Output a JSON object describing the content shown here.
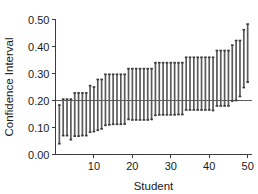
{
  "chart_data": {
    "type": "bar",
    "title": "",
    "subtitle": "",
    "xlabel": "Student",
    "ylabel": "Confidence Interval",
    "xlim": [
      0,
      51
    ],
    "ylim": [
      0.0,
      0.5
    ],
    "grid": false,
    "legend": null,
    "x_ticks": [
      10,
      20,
      30,
      40,
      50
    ],
    "x_tick_labels": [
      "10",
      "20",
      "30",
      "40",
      "50"
    ],
    "y_ticks": [
      0.0,
      0.1,
      0.2,
      0.3,
      0.4,
      0.5
    ],
    "y_tick_labels": [
      "0.00",
      "0.10",
      "0.20",
      "0.30",
      "0.40",
      "0.50"
    ],
    "reference_line": {
      "orientation": "horizontal",
      "value": 0.2,
      "label": ""
    },
    "categories": [
      1,
      2,
      3,
      4,
      5,
      6,
      7,
      8,
      9,
      10,
      11,
      12,
      13,
      14,
      15,
      16,
      17,
      18,
      19,
      20,
      21,
      22,
      23,
      24,
      25,
      26,
      27,
      28,
      29,
      30,
      31,
      32,
      33,
      34,
      35,
      36,
      37,
      38,
      39,
      40,
      41,
      42,
      43,
      44,
      45,
      46,
      47,
      48,
      49,
      50
    ],
    "series": [
      {
        "name": "lower",
        "values": [
          0.04,
          0.07,
          0.07,
          0.055,
          0.068,
          0.068,
          0.07,
          0.07,
          0.083,
          0.085,
          0.09,
          0.095,
          0.108,
          0.11,
          0.112,
          0.112,
          0.112,
          0.113,
          0.13,
          0.128,
          0.128,
          0.128,
          0.128,
          0.128,
          0.13,
          0.145,
          0.147,
          0.147,
          0.147,
          0.147,
          0.147,
          0.148,
          0.148,
          0.165,
          0.165,
          0.165,
          0.165,
          0.165,
          0.165,
          0.165,
          0.163,
          0.18,
          0.18,
          0.18,
          0.18,
          0.198,
          0.2,
          0.215,
          0.248,
          0.268
        ]
      },
      {
        "name": "upper",
        "values": [
          0.183,
          0.205,
          0.205,
          0.205,
          0.228,
          0.228,
          0.228,
          0.228,
          0.255,
          0.25,
          0.278,
          0.278,
          0.297,
          0.297,
          0.297,
          0.297,
          0.297,
          0.297,
          0.318,
          0.318,
          0.318,
          0.318,
          0.318,
          0.318,
          0.318,
          0.34,
          0.34,
          0.34,
          0.34,
          0.34,
          0.34,
          0.34,
          0.34,
          0.36,
          0.36,
          0.36,
          0.36,
          0.36,
          0.36,
          0.36,
          0.36,
          0.385,
          0.385,
          0.385,
          0.385,
          0.405,
          0.422,
          0.422,
          0.462,
          0.483
        ]
      }
    ]
  }
}
